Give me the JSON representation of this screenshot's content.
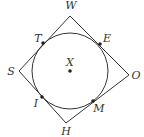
{
  "diagram": {
    "stroke_color": "#333333",
    "center": {
      "label": "X",
      "x": 70,
      "y": 71
    },
    "radius": 38,
    "vertices": [
      {
        "label": "W",
        "x": 70,
        "y": 16,
        "lx": 71,
        "ly": 9
      },
      {
        "label": "O",
        "x": 129,
        "y": 75,
        "lx": 136,
        "ly": 79
      },
      {
        "label": "H",
        "x": 66,
        "y": 123,
        "lx": 66,
        "ly": 135
      },
      {
        "label": "S",
        "x": 19,
        "y": 71,
        "lx": 11,
        "ly": 75
      }
    ],
    "tangent_points": [
      {
        "label": "T",
        "x": 43,
        "y": 43,
        "lx": 38,
        "ly": 42
      },
      {
        "label": "E",
        "x": 100,
        "y": 44,
        "lx": 107,
        "ly": 42
      },
      {
        "label": "M",
        "x": 93,
        "y": 101,
        "lx": 99,
        "ly": 112
      },
      {
        "label": "I",
        "x": 42,
        "y": 97,
        "lx": 36,
        "ly": 107
      }
    ]
  }
}
